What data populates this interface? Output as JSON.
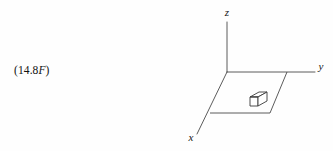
{
  "page": {
    "background_color": "#fefefe",
    "ink_color": "#3a3a3a",
    "text_color": "#111111"
  },
  "reference": {
    "prefix": "(14.8",
    "italic_suffix": "F",
    "close": ")",
    "full_text": "(14.8F)"
  },
  "figure": {
    "name": "three-dimensional-coordinate-axes-with-surface-element",
    "axes": [
      {
        "id": "z",
        "label": "z",
        "direction": "up",
        "label_x": 57,
        "label_y": 14
      },
      {
        "id": "y",
        "label": "y",
        "direction": "right",
        "label_x": 151,
        "label_y": 70
      },
      {
        "id": "x",
        "label": "x",
        "direction": "lower-left",
        "label_x": 20,
        "label_y": 139
      }
    ],
    "origin": {
      "x": 57,
      "y": 72
    },
    "plane": {
      "name": "xy-plane-parallelogram",
      "corners": [
        {
          "x": 57,
          "y": 72
        },
        {
          "x": 117,
          "y": 72
        },
        {
          "x": 100,
          "y": 113
        },
        {
          "x": 40,
          "y": 113
        }
      ]
    },
    "element": {
      "name": "differential-area-element-box",
      "center": {
        "x": 87,
        "y": 100
      },
      "width": 15,
      "height": 9,
      "depth": 8
    },
    "line_width": 0.9
  }
}
